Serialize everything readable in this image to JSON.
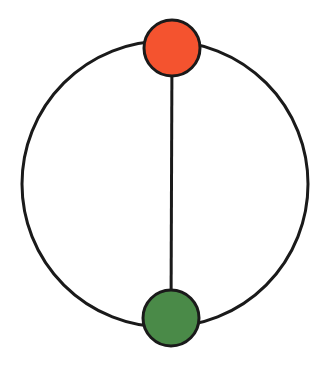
{
  "canvas": {
    "width": 324,
    "height": 367,
    "background": "#ffffff"
  },
  "diagram": {
    "type": "graph",
    "stroke_color": "#1a1a1a",
    "outer_cycle": {
      "cx": 165,
      "cy": 184,
      "r": 143,
      "stroke_width": 3
    },
    "edges": [
      {
        "id": "chord",
        "from": "top",
        "to": "bottom",
        "x1": 172,
        "y1": 48,
        "x2": 171,
        "y2": 317,
        "stroke_width": 3
      }
    ],
    "nodes": [
      {
        "id": "top",
        "label": "",
        "cx": 172,
        "cy": 48,
        "r": 28,
        "fill": "#f4532f",
        "stroke_width": 3
      },
      {
        "id": "bottom",
        "label": "",
        "cx": 171,
        "cy": 318,
        "r": 28,
        "fill": "#4a8a48",
        "stroke_width": 3
      }
    ]
  }
}
